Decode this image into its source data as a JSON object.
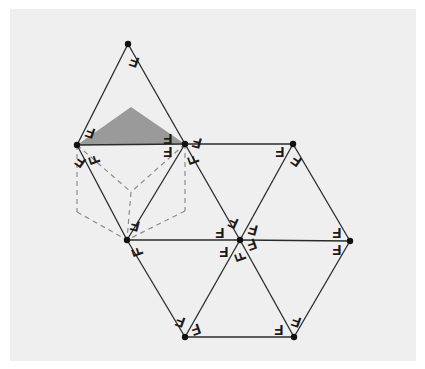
{
  "figure": {
    "background_color": "#ffffff",
    "panel_color": "#efefef",
    "line_color": "#2b2b2b",
    "dash_color": "#8c8c8c",
    "shade_color": "#9a9a9a",
    "vertex_color": "#111111",
    "letter": "F"
  },
  "vertices": [
    {
      "name": "apex-top",
      "x": 128,
      "y": 44
    },
    {
      "name": "upper-left",
      "x": 77,
      "y": 145
    },
    {
      "name": "upper-middle",
      "x": 185,
      "y": 144
    },
    {
      "name": "upper-right",
      "x": 293,
      "y": 144
    },
    {
      "name": "middle-left",
      "x": 127,
      "y": 240
    },
    {
      "name": "middle-center",
      "x": 240,
      "y": 240
    },
    {
      "name": "middle-right",
      "x": 350,
      "y": 241
    },
    {
      "name": "bottom-left",
      "x": 185,
      "y": 337
    },
    {
      "name": "bottom-right",
      "x": 294,
      "y": 337
    }
  ],
  "solid_edges": [
    {
      "from": "apex-top",
      "to": "upper-left"
    },
    {
      "from": "apex-top",
      "to": "upper-middle"
    },
    {
      "from": "upper-left",
      "to": "upper-middle"
    },
    {
      "from": "upper-middle",
      "to": "upper-right"
    },
    {
      "from": "upper-left",
      "to": "middle-left"
    },
    {
      "from": "upper-middle",
      "to": "middle-left"
    },
    {
      "from": "upper-middle",
      "to": "middle-center"
    },
    {
      "from": "upper-right",
      "to": "middle-center"
    },
    {
      "from": "upper-right",
      "to": "middle-right"
    },
    {
      "from": "middle-left",
      "to": "middle-center"
    },
    {
      "from": "middle-center",
      "to": "middle-right"
    },
    {
      "from": "middle-left",
      "to": "bottom-left"
    },
    {
      "from": "middle-center",
      "to": "bottom-left"
    },
    {
      "from": "middle-center",
      "to": "bottom-right"
    },
    {
      "from": "middle-right",
      "to": "bottom-right"
    },
    {
      "from": "bottom-left",
      "to": "bottom-right"
    }
  ],
  "shaded_triangle": {
    "name": "shaded-face",
    "points": "77,145 131,107 185,144"
  },
  "cube": {
    "name": "dashed-cube",
    "center_vertex": {
      "x": 131,
      "y": 192
    },
    "nodes": [
      {
        "name": "cube-top-back",
        "x": 77,
        "y": 145
      },
      {
        "name": "cube-top-right",
        "x": 185,
        "y": 144
      },
      {
        "name": "cube-top-front",
        "x": 131,
        "y": 192
      },
      {
        "name": "cube-left",
        "x": 77,
        "y": 212
      },
      {
        "name": "cube-right",
        "x": 185,
        "y": 211
      },
      {
        "name": "cube-bottom",
        "x": 127,
        "y": 240
      }
    ],
    "dashed_edges": [
      {
        "from": "cube-top-back",
        "to": "cube-top-front"
      },
      {
        "from": "cube-top-right",
        "to": "cube-top-front"
      },
      {
        "from": "cube-top-front",
        "to": "cube-bottom"
      },
      {
        "from": "cube-top-back",
        "to": "cube-left"
      },
      {
        "from": "cube-top-right",
        "to": "cube-right"
      },
      {
        "from": "cube-left",
        "to": "cube-bottom"
      },
      {
        "from": "cube-right",
        "to": "cube-bottom"
      }
    ]
  },
  "f_markers": [
    {
      "name": "f-apex-top",
      "x": 134,
      "y": 62,
      "rotation": 200
    },
    {
      "name": "f-upper-left-a",
      "x": 90,
      "y": 133,
      "rotation": 200
    },
    {
      "name": "f-upper-left-b",
      "x": 80,
      "y": 162,
      "rotation": 215
    },
    {
      "name": "f-upper-left-c",
      "x": 94,
      "y": 160,
      "rotation": 250
    },
    {
      "name": "f-upper-mid-a",
      "x": 168,
      "y": 139,
      "rotation": 180
    },
    {
      "name": "f-upper-mid-b",
      "x": 168,
      "y": 152,
      "rotation": 180
    },
    {
      "name": "f-upper-mid-c",
      "x": 197,
      "y": 143,
      "rotation": 195
    },
    {
      "name": "f-upper-mid-d",
      "x": 193,
      "y": 160,
      "rotation": 250
    },
    {
      "name": "f-upper-right-a",
      "x": 280,
      "y": 152,
      "rotation": 180
    },
    {
      "name": "f-upper-right-b",
      "x": 296,
      "y": 161,
      "rotation": 215
    },
    {
      "name": "f-middle-left-a",
      "x": 135,
      "y": 226,
      "rotation": 195
    },
    {
      "name": "f-middle-left-b",
      "x": 137,
      "y": 252,
      "rotation": 250
    },
    {
      "name": "f-center-w",
      "x": 220,
      "y": 233,
      "rotation": 180
    },
    {
      "name": "f-center-nw",
      "x": 233,
      "y": 223,
      "rotation": 205
    },
    {
      "name": "f-center-ne",
      "x": 253,
      "y": 230,
      "rotation": 195
    },
    {
      "name": "f-center-e",
      "x": 252,
      "y": 245,
      "rotation": 160
    },
    {
      "name": "f-center-sw",
      "x": 224,
      "y": 252,
      "rotation": 180
    },
    {
      "name": "f-center-s",
      "x": 240,
      "y": 257,
      "rotation": 250
    },
    {
      "name": "f-middle-right-a",
      "x": 337,
      "y": 233,
      "rotation": 180
    },
    {
      "name": "f-middle-right-b",
      "x": 337,
      "y": 250,
      "rotation": 180
    },
    {
      "name": "f-bottom-left-a",
      "x": 180,
      "y": 322,
      "rotation": 200
    },
    {
      "name": "f-bottom-left-b",
      "x": 196,
      "y": 330,
      "rotation": 160
    },
    {
      "name": "f-bottom-right-a",
      "x": 279,
      "y": 330,
      "rotation": 180
    },
    {
      "name": "f-bottom-right-b",
      "x": 296,
      "y": 322,
      "rotation": 200
    }
  ]
}
